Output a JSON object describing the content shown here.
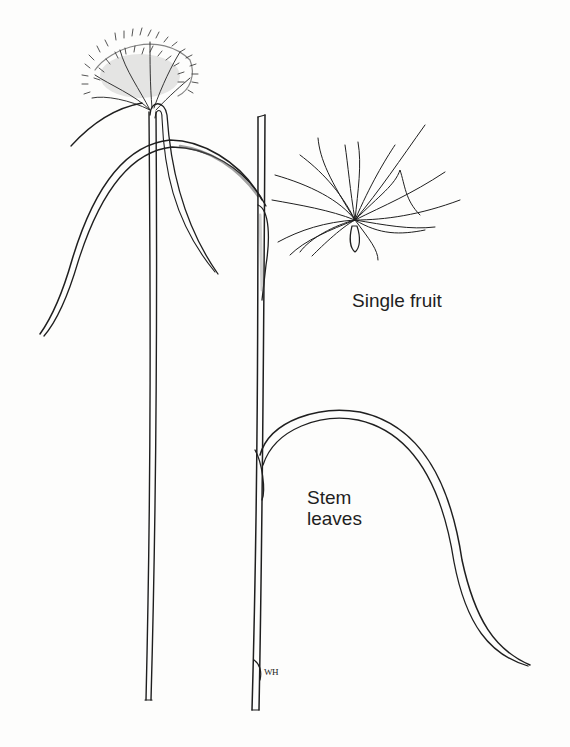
{
  "illustration": {
    "subject": "Grass-like plant with stem, stem leaves, flower head and seed",
    "labels": {
      "single_fruit": "Single fruit",
      "stem_leaves": "Stem\nleaves"
    },
    "signature": "WH",
    "colors": {
      "background": "#fdfdfc",
      "ink": "#1f1f1f",
      "fill": "#f4f4f2"
    }
  }
}
